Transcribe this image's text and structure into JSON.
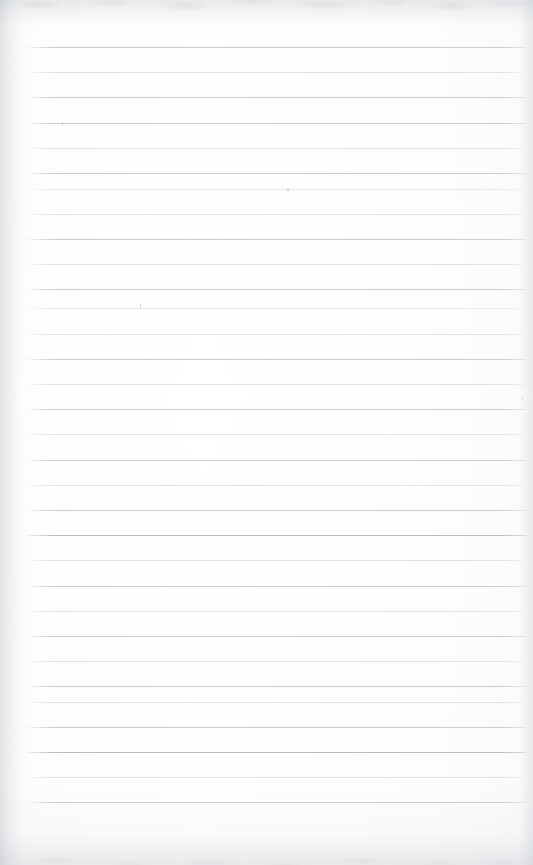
{
  "document": {
    "kind": "scanned-ruled-notebook-page",
    "title": "Blank Lined Notebook Page",
    "description": "A scanned, otherwise blank sheet of wide-ruled notebook paper with no handwriting or printed text.",
    "page_width_px": 533,
    "page_height_px": 865,
    "paper_color": "#fefefe",
    "rule_color": "#d2d5d9",
    "text_content": "",
    "handwriting_present": false,
    "printed_text_present": false
  },
  "ruling": {
    "line_count": 31,
    "spacing_px": 25.2,
    "first_line_y_px": 47,
    "last_line_y_px": 802,
    "line_left_x_px": 27,
    "line_right_x_px": 527,
    "line_thickness_px": 1,
    "top_margin_px": 47,
    "bottom_margin_px": 63,
    "left_margin_px": 27,
    "right_margin_px": 6,
    "vertical_margin_rule": false,
    "lines": [
      {
        "index": 1,
        "y": 47,
        "weight": "mid"
      },
      {
        "index": 2,
        "y": 72,
        "weight": "light"
      },
      {
        "index": 3,
        "y": 97,
        "weight": "mid"
      },
      {
        "index": 4,
        "y": 123,
        "weight": "mid"
      },
      {
        "index": 5,
        "y": 148,
        "weight": "light"
      },
      {
        "index": 6,
        "y": 173,
        "weight": "mid"
      },
      {
        "index": 7,
        "y": 189,
        "weight": "faint"
      },
      {
        "index": 8,
        "y": 214,
        "weight": "light"
      },
      {
        "index": 9,
        "y": 239,
        "weight": "mid"
      },
      {
        "index": 10,
        "y": 264,
        "weight": "light"
      },
      {
        "index": 11,
        "y": 289,
        "weight": "mid"
      },
      {
        "index": 12,
        "y": 308,
        "weight": "faint"
      },
      {
        "index": 13,
        "y": 334,
        "weight": "light"
      },
      {
        "index": 14,
        "y": 359,
        "weight": "mid"
      },
      {
        "index": 15,
        "y": 384,
        "weight": "light"
      },
      {
        "index": 16,
        "y": 409,
        "weight": "mid"
      },
      {
        "index": 17,
        "y": 434,
        "weight": "light"
      },
      {
        "index": 18,
        "y": 460,
        "weight": "mid"
      },
      {
        "index": 19,
        "y": 485,
        "weight": "light"
      },
      {
        "index": 20,
        "y": 510,
        "weight": "mid"
      },
      {
        "index": 21,
        "y": 535,
        "weight": "dark"
      },
      {
        "index": 22,
        "y": 560,
        "weight": "light"
      },
      {
        "index": 23,
        "y": 586,
        "weight": "mid"
      },
      {
        "index": 24,
        "y": 611,
        "weight": "light"
      },
      {
        "index": 25,
        "y": 636,
        "weight": "mid"
      },
      {
        "index": 26,
        "y": 661,
        "weight": "light"
      },
      {
        "index": 27,
        "y": 686,
        "weight": "mid"
      },
      {
        "index": 28,
        "y": 702,
        "weight": "light"
      },
      {
        "index": 29,
        "y": 727,
        "weight": "mid"
      },
      {
        "index": 30,
        "y": 752,
        "weight": "dark"
      },
      {
        "index": 31,
        "y": 777,
        "weight": "light"
      },
      {
        "index": 32,
        "y": 802,
        "weight": "mid"
      }
    ]
  },
  "artifacts": {
    "note": "Small stray specks and scan speckle visible on the otherwise blank page.",
    "specks": [
      {
        "name": "speck-upper-left",
        "x": 62,
        "y": 122,
        "w": 1,
        "h": 4
      },
      {
        "name": "speck-upper-center",
        "x": 287,
        "y": 188,
        "w": 2,
        "h": 3
      },
      {
        "name": "speck-mid-left",
        "x": 140,
        "y": 304,
        "w": 1,
        "h": 5
      },
      {
        "name": "speck-right-edge",
        "x": 522,
        "y": 398,
        "w": 1,
        "h": 3
      }
    ],
    "edge_shading": {
      "top_band": true,
      "bottom_band": true,
      "left_gutter": true,
      "right_gutter": true
    }
  }
}
